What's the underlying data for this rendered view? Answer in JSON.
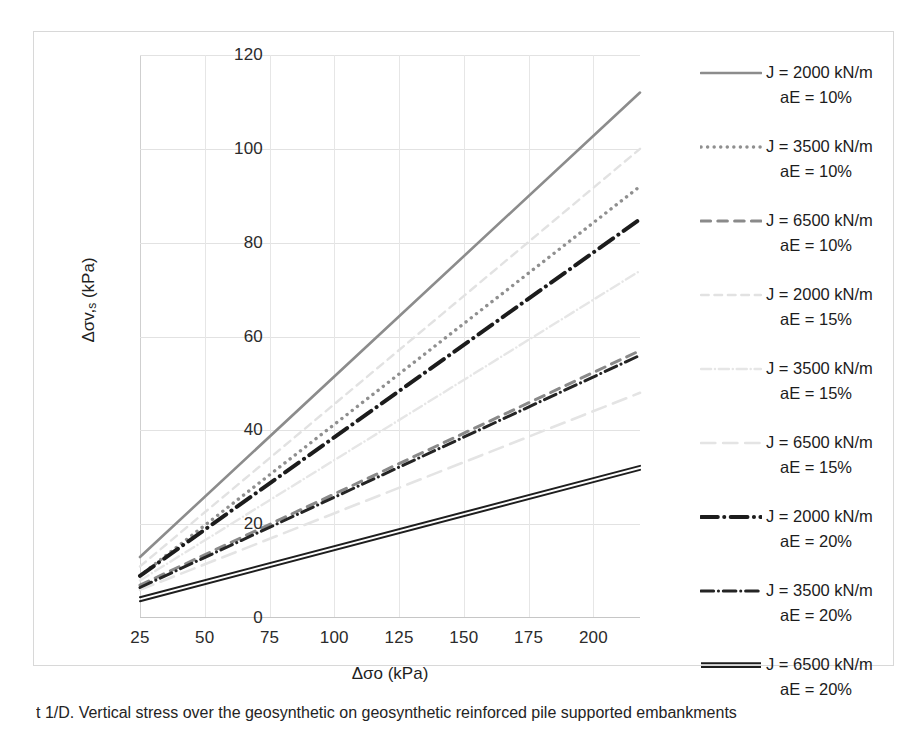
{
  "chart_data": {
    "type": "line",
    "title": "",
    "xlabel": "Δσo (kPa)",
    "ylabel": "Δσv,s (kPa)",
    "xlim": [
      25,
      218
    ],
    "ylim": [
      0,
      120
    ],
    "xticks": [
      25,
      50,
      75,
      100,
      125,
      150,
      175,
      200
    ],
    "yticks": [
      0,
      20,
      40,
      60,
      80,
      100,
      120
    ],
    "grid": true,
    "legend_position": "right",
    "x": [
      25,
      218
    ],
    "series": [
      {
        "name": "J = 2000 kN/m aE = 10%",
        "J": 2000,
        "aE": "10%",
        "values": [
          13.0,
          112.0
        ],
        "color": "#8c8c8c",
        "style": "solid",
        "width": 2.6
      },
      {
        "name": "J = 3500 kN/m aE = 10%",
        "J": 3500,
        "aE": "10%",
        "values": [
          9.0,
          92.0
        ],
        "color": "#8f8f8f",
        "style": "dotted",
        "width": 3.4
      },
      {
        "name": "J = 6500 kN/m aE = 10%",
        "J": 6500,
        "aE": "10%",
        "values": [
          7.0,
          57.0
        ],
        "color": "#8a8a8a",
        "style": "dashed",
        "width": 3.0
      },
      {
        "name": "J = 2000 kN/m aE = 15%",
        "J": 2000,
        "aE": "15%",
        "values": [
          11.0,
          100.0
        ],
        "color": "#e2e2e2",
        "style": "dashed",
        "width": 2.4
      },
      {
        "name": "J = 3500 kN/m aE = 15%",
        "J": 3500,
        "aE": "15%",
        "values": [
          8.0,
          74.0
        ],
        "color": "#e6e6e6",
        "style": "dash-dot",
        "width": 2.4
      },
      {
        "name": "J = 6500 kN/m aE = 15%",
        "J": 6500,
        "aE": "15%",
        "values": [
          6.0,
          48.0
        ],
        "color": "#e4e4e4",
        "style": "long-dash",
        "width": 2.6
      },
      {
        "name": "J = 2000 kN/m aE = 20%",
        "J": 2000,
        "aE": "20%",
        "values": [
          9.0,
          85.0
        ],
        "color": "#1c1c1c",
        "style": "dash-dot",
        "width": 4.0
      },
      {
        "name": "J = 3500 kN/m aE = 20%",
        "J": 3500,
        "aE": "20%",
        "values": [
          6.5,
          56.0
        ],
        "color": "#242424",
        "style": "dash-dot",
        "width": 3.0
      },
      {
        "name": "J = 6500 kN/m aE = 20%",
        "J": 6500,
        "aE": "20%",
        "values": [
          4.0,
          32.0
        ],
        "color": "#1e1e1e",
        "style": "double",
        "width": 2.0
      }
    ]
  },
  "axes": {
    "y": {
      "title": "Δσv,s (kPa)",
      "title_main": "Δσv,",
      "title_sub": "s",
      "title_unit": " (kPa)",
      "ticks": [
        "0",
        "20",
        "40",
        "60",
        "80",
        "100",
        "120"
      ]
    },
    "x": {
      "title": "Δσo (kPa)",
      "ticks": [
        "25",
        "50",
        "75",
        "100",
        "125",
        "150",
        "175",
        "200"
      ]
    }
  },
  "legend": {
    "items": [
      {
        "line1": "J = 2000 kN/m",
        "line2": "aE = 10%",
        "swatch": "solid-gray-line-icon"
      },
      {
        "line1": "J = 3500 kN/m",
        "line2": "aE = 10%",
        "swatch": "dotted-gray-line-icon"
      },
      {
        "line1": "J = 6500 kN/m",
        "line2": "aE = 10%",
        "swatch": "dashed-gray-line-icon"
      },
      {
        "line1": "J = 2000 kN/m",
        "line2": "aE = 15%",
        "swatch": "faint-dashed-line-icon"
      },
      {
        "line1": "J = 3500 kN/m",
        "line2": "aE = 15%",
        "swatch": "faint-dashdot-line-icon"
      },
      {
        "line1": "J = 6500 kN/m",
        "line2": "aE = 15%",
        "swatch": "faint-longdash-line-icon"
      },
      {
        "line1": "J = 2000 kN/m",
        "line2": "aE = 20%",
        "swatch": "thick-black-dashdot-line-icon"
      },
      {
        "line1": "J = 3500 kN/m",
        "line2": "aE = 20%",
        "swatch": "black-dashdot-line-icon"
      },
      {
        "line1": "J = 6500 kN/m",
        "line2": "aE = 20%",
        "swatch": "black-double-line-icon"
      }
    ]
  },
  "caption": {
    "text": "t 1/D. Vertical stress over the geosynthetic on geosynthetic reinforced pile supported embankments"
  },
  "colors": {
    "gray_series": "#8c8c8c",
    "faint_series": "#e3e3e3",
    "black_series": "#1c1c1c",
    "grid": "#e2e2e2",
    "frame": "#d8d8d8"
  }
}
